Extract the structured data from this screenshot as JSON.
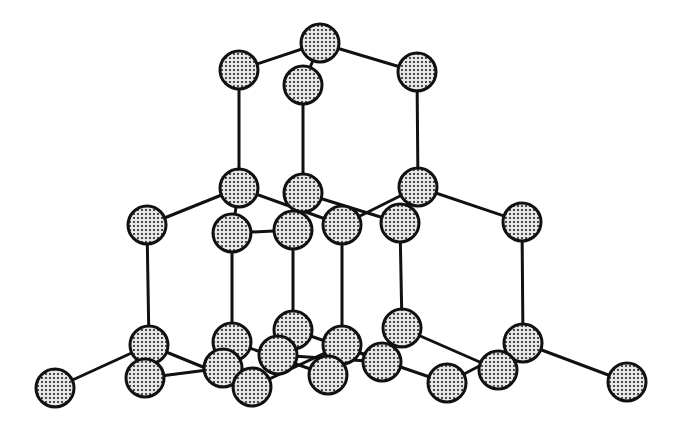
{
  "diagram": {
    "type": "crystal-lattice",
    "title": "",
    "colors": {
      "background": "#ffffff",
      "bond": "#111111",
      "atom_outline": "#111111",
      "atom_fill_light": "#e6e6e6",
      "atom_fill_dot": "#222222"
    },
    "atom_radius": 19,
    "atoms": [
      {
        "id": "A0",
        "x": 320,
        "y": 43
      },
      {
        "id": "A1",
        "x": 239,
        "y": 70
      },
      {
        "id": "A2",
        "x": 303,
        "y": 85
      },
      {
        "id": "A3",
        "x": 417,
        "y": 72
      },
      {
        "id": "B1",
        "x": 239,
        "y": 188
      },
      {
        "id": "B2",
        "x": 303,
        "y": 193
      },
      {
        "id": "B3",
        "x": 418,
        "y": 187
      },
      {
        "id": "C0",
        "x": 147,
        "y": 225
      },
      {
        "id": "C1",
        "x": 232,
        "y": 233
      },
      {
        "id": "C2",
        "x": 293,
        "y": 230
      },
      {
        "id": "C3",
        "x": 342,
        "y": 225
      },
      {
        "id": "C4",
        "x": 400,
        "y": 223
      },
      {
        "id": "C5",
        "x": 522,
        "y": 222
      },
      {
        "id": "D0",
        "x": 149,
        "y": 345
      },
      {
        "id": "D1",
        "x": 232,
        "y": 342
      },
      {
        "id": "D2",
        "x": 293,
        "y": 330
      },
      {
        "id": "D3",
        "x": 342,
        "y": 345
      },
      {
        "id": "D4",
        "x": 402,
        "y": 328
      },
      {
        "id": "D5",
        "x": 523,
        "y": 343
      },
      {
        "id": "E0",
        "x": 55,
        "y": 388
      },
      {
        "id": "E1",
        "x": 145,
        "y": 378
      },
      {
        "id": "E2",
        "x": 223,
        "y": 368
      },
      {
        "id": "E3",
        "x": 252,
        "y": 387
      },
      {
        "id": "E4",
        "x": 278,
        "y": 355
      },
      {
        "id": "E5",
        "x": 328,
        "y": 375
      },
      {
        "id": "E6",
        "x": 382,
        "y": 362
      },
      {
        "id": "E7",
        "x": 447,
        "y": 383
      },
      {
        "id": "E8",
        "x": 498,
        "y": 370
      },
      {
        "id": "E9",
        "x": 627,
        "y": 382
      }
    ],
    "bonds": [
      [
        "A0",
        "A1"
      ],
      [
        "A0",
        "A2"
      ],
      [
        "A0",
        "A3"
      ],
      [
        "A1",
        "B1"
      ],
      [
        "A2",
        "B2"
      ],
      [
        "A3",
        "B3"
      ],
      [
        "B1",
        "C0"
      ],
      [
        "B1",
        "C1"
      ],
      [
        "B1",
        "C3"
      ],
      [
        "B2",
        "C2"
      ],
      [
        "B2",
        "C4"
      ],
      [
        "B3",
        "C4"
      ],
      [
        "B3",
        "C5"
      ],
      [
        "B3",
        "C3"
      ],
      [
        "C1",
        "C2"
      ],
      [
        "C0",
        "D0"
      ],
      [
        "C1",
        "D1"
      ],
      [
        "C2",
        "D2"
      ],
      [
        "C3",
        "D3"
      ],
      [
        "C4",
        "D4"
      ],
      [
        "C5",
        "D5"
      ],
      [
        "D0",
        "E0"
      ],
      [
        "D0",
        "E1"
      ],
      [
        "D0",
        "E3"
      ],
      [
        "D1",
        "E2"
      ],
      [
        "D1",
        "E5"
      ],
      [
        "D2",
        "E4"
      ],
      [
        "D2",
        "E7"
      ],
      [
        "D3",
        "E3"
      ],
      [
        "D3",
        "E5"
      ],
      [
        "D3",
        "E6"
      ],
      [
        "D4",
        "E6"
      ],
      [
        "D4",
        "E8"
      ],
      [
        "D5",
        "E8"
      ],
      [
        "D5",
        "E9"
      ],
      [
        "D5",
        "E7"
      ],
      [
        "E1",
        "E2"
      ],
      [
        "E4",
        "E6"
      ]
    ]
  }
}
